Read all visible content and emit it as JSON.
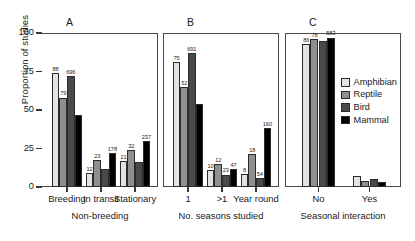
{
  "axes": {
    "ylabel": "Proportion of studies",
    "yticks": [
      0,
      25,
      50,
      75,
      100
    ],
    "ylim_min": 0,
    "ylim_max": 100
  },
  "legend": {
    "items": [
      {
        "label": "Amphibian",
        "color": "#e3e3e3"
      },
      {
        "label": "Reptile",
        "color": "#8f8f8f"
      },
      {
        "label": "Bird",
        "color": "#4a4a4a"
      },
      {
        "label": "Mammal",
        "color": "#000000"
      }
    ]
  },
  "panels": [
    {
      "letter": "A",
      "xtitle": "Non-breeding",
      "categories": [
        "Breeding",
        "In transit",
        "Stationary"
      ]
    },
    {
      "letter": "B",
      "xtitle": "No. seasons studied",
      "categories": [
        "1",
        ">1",
        "Year round"
      ]
    },
    {
      "letter": "C",
      "xtitle": "Seasonal interaction",
      "categories": [
        "No",
        "Yes"
      ]
    }
  ],
  "chart_data": [
    {
      "type": "bar",
      "panel": "A",
      "title": "",
      "xlabel": "Non-breeding",
      "ylabel": "Proportion of studies",
      "ylim": [
        0,
        100
      ],
      "grid": false,
      "legend_position": "right",
      "categories": [
        "Breeding",
        "In transit",
        "Stationary"
      ],
      "series": [
        {
          "name": "Amphibian",
          "color": "#e3e3e3",
          "values": [
            74,
            9,
            17
          ],
          "labels": [
            "88",
            "12",
            "21"
          ]
        },
        {
          "name": "Reptile",
          "color": "#8f8f8f",
          "values": [
            58,
            17.5,
            24
          ],
          "labels": [
            "79",
            "23",
            "32"
          ]
        },
        {
          "name": "Bird",
          "color": "#4a4a4a",
          "values": [
            72,
            11.5,
            16.5
          ],
          "labels": [
            "696",
            "",
            ""
          ]
        },
        {
          "name": "Mammal",
          "color": "#000000",
          "values": [
            47,
            22,
            30
          ],
          "labels": [
            "",
            "178",
            "237"
          ]
        }
      ]
    },
    {
      "type": "bar",
      "panel": "B",
      "title": "",
      "xlabel": "No. seasons studied",
      "ylabel": "Proportion of studies",
      "ylim": [
        0,
        100
      ],
      "grid": false,
      "legend_position": "right",
      "categories": [
        "1",
        ">1",
        "Year round"
      ],
      "series": [
        {
          "name": "Amphibian",
          "color": "#e3e3e3",
          "values": [
            81,
            11,
            8.5
          ],
          "labels": [
            "75",
            "10",
            "8"
          ]
        },
        {
          "name": "Reptile",
          "color": "#8f8f8f",
          "values": [
            65,
            15,
            21.5
          ],
          "labels": [
            "52",
            "12",
            "18"
          ]
        },
        {
          "name": "Bird",
          "color": "#4a4a4a",
          "values": [
            87,
            8,
            6
          ],
          "labels": [
            "691",
            "23",
            "54"
          ]
        },
        {
          "name": "Mammal",
          "color": "#000000",
          "values": [
            54,
            11.5,
            38
          ],
          "labels": [
            "",
            "47",
            "160"
          ]
        }
      ]
    },
    {
      "type": "bar",
      "panel": "C",
      "title": "",
      "xlabel": "Seasonal interaction",
      "ylabel": "Proportion of studies",
      "ylim": [
        0,
        100
      ],
      "grid": false,
      "legend_position": "right",
      "categories": [
        "No",
        "Yes"
      ],
      "series": [
        {
          "name": "Amphibian",
          "color": "#e3e3e3",
          "values": [
            93,
            7
          ],
          "labels": [
            "86",
            ""
          ]
        },
        {
          "name": "Reptile",
          "color": "#8f8f8f",
          "values": [
            96,
            4
          ],
          "labels": [
            "78",
            ""
          ]
        },
        {
          "name": "Bird",
          "color": "#4a4a4a",
          "values": [
            95,
            5
          ],
          "labels": [
            "",
            ""
          ]
        },
        {
          "name": "Mammal",
          "color": "#000000",
          "values": [
            97,
            3.5
          ],
          "labels": [
            "583",
            ""
          ]
        }
      ]
    }
  ]
}
